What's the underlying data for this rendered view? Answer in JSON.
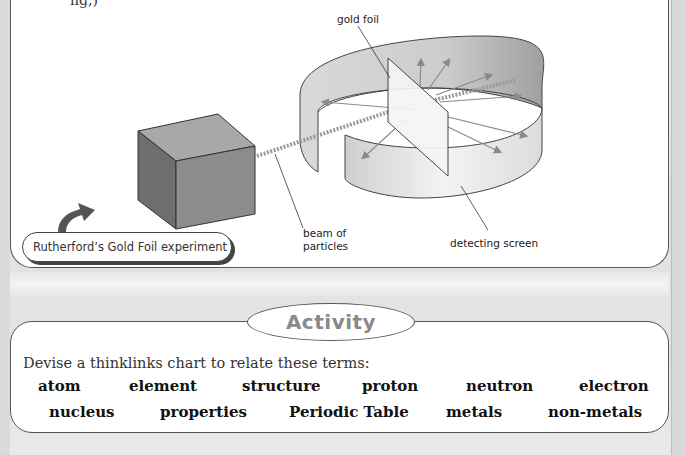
{
  "figure": {
    "top_text_fragment": "ng,)",
    "labels": {
      "gold_foil": "gold foil",
      "beam_line1": "beam of",
      "beam_line2": "particles",
      "detecting_screen": "detecting screen"
    },
    "caption": "Rutherford’s Gold Foil experiment",
    "colors": {
      "cube_front": "#8c8c8c",
      "cube_side": "#6e6e6e",
      "cube_top": "#a8a8a8",
      "screen_inner": "#bdbdbd",
      "screen_outer": "#ececec",
      "arrow": "#8a8a8a",
      "caption_arrow": "#555555"
    }
  },
  "activity": {
    "title": "Activity",
    "instruction": "Devise a thinklinks chart to relate these terms:",
    "terms_row1": [
      "atom",
      "element",
      "structure",
      "proton",
      "neutron",
      "electron"
    ],
    "terms_row2": [
      "nucleus",
      "properties",
      "Periodic Table",
      "metals",
      "non-metals"
    ]
  }
}
